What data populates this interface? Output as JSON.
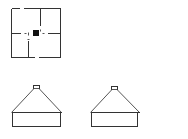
{
  "figure": {
    "background": "#ffffff",
    "ink_color": "#333333",
    "maze": {
      "name": "square-maze-with-center-block",
      "center_block_color": "#111111"
    },
    "houses": [
      {
        "name": "house-left",
        "has_chimney": true
      },
      {
        "name": "house-right",
        "has_chimney": true
      }
    ]
  }
}
